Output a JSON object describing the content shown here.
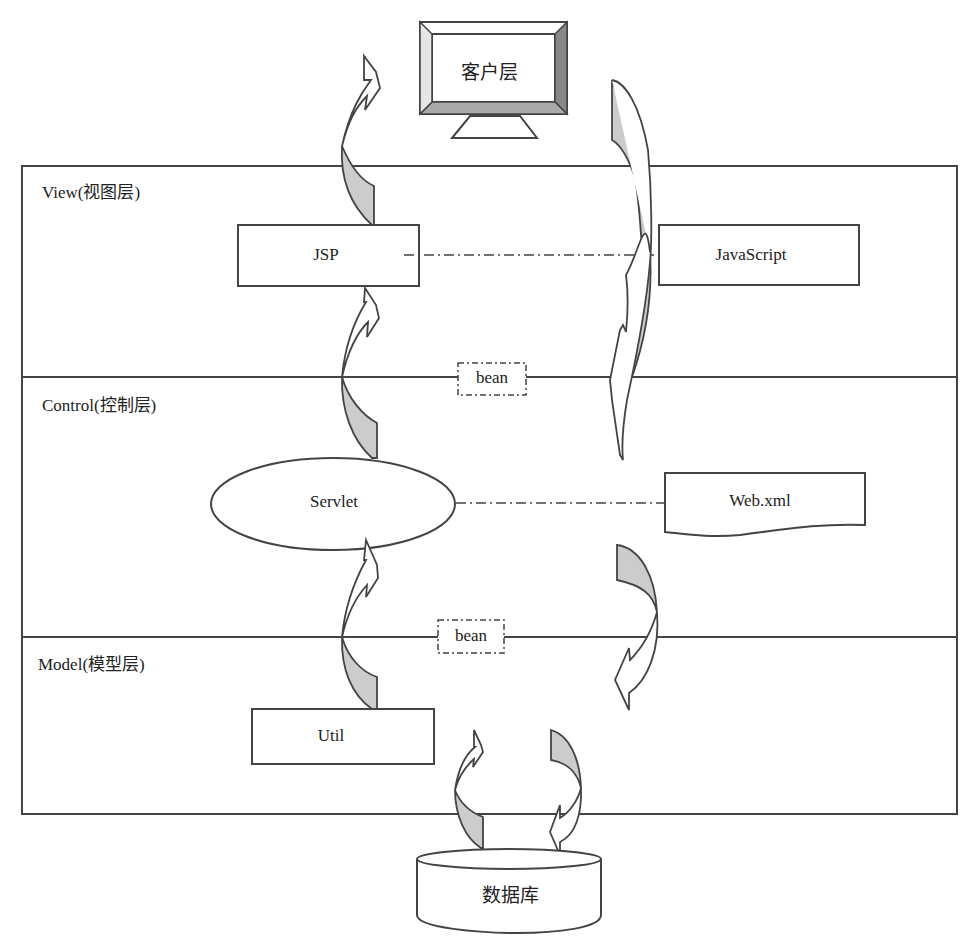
{
  "diagram": {
    "client": {
      "label": "客户层",
      "shape": "monitor"
    },
    "layers": [
      {
        "id": "view",
        "label": "View(视图层)"
      },
      {
        "id": "control",
        "label": "Control(控制层)"
      },
      {
        "id": "model",
        "label": "Model(模型层)"
      }
    ],
    "nodes": {
      "jsp": {
        "label": "JSP",
        "shape": "rectangle"
      },
      "javascript": {
        "label": "JavaScript",
        "shape": "rectangle"
      },
      "servlet": {
        "label": "Servlet",
        "shape": "ellipse"
      },
      "webxml": {
        "label": "Web.xml",
        "shape": "document"
      },
      "util": {
        "label": "Util",
        "shape": "rectangle"
      },
      "database": {
        "label": "数据库",
        "shape": "cylinder"
      }
    },
    "connectors": [
      {
        "from": "jsp",
        "to": "javascript",
        "style": "dash-dot"
      },
      {
        "from": "servlet",
        "to": "webxml",
        "style": "dash-dot"
      }
    ],
    "bean_labels": [
      {
        "between": [
          "view",
          "control"
        ],
        "label": "bean"
      },
      {
        "between": [
          "control",
          "model"
        ],
        "label": "bean"
      }
    ],
    "arrows": [
      {
        "from": "jsp",
        "to": "client",
        "direction": "up",
        "type": "curved-block"
      },
      {
        "from": "servlet",
        "to": "jsp",
        "direction": "up",
        "type": "curved-block"
      },
      {
        "from": "util",
        "to": "servlet",
        "direction": "up",
        "type": "curved-block"
      },
      {
        "from": "database",
        "to": "util",
        "direction": "up",
        "type": "curved-block"
      },
      {
        "from": "client",
        "to": "control",
        "direction": "down",
        "type": "curved-block"
      },
      {
        "from": "control",
        "to": "model",
        "direction": "down",
        "type": "curved-block"
      },
      {
        "from": "model",
        "to": "database",
        "direction": "down",
        "type": "curved-block"
      }
    ],
    "colors": {
      "stroke": "#444444",
      "arrow_fill": "#cccccc",
      "background": "#ffffff"
    }
  }
}
